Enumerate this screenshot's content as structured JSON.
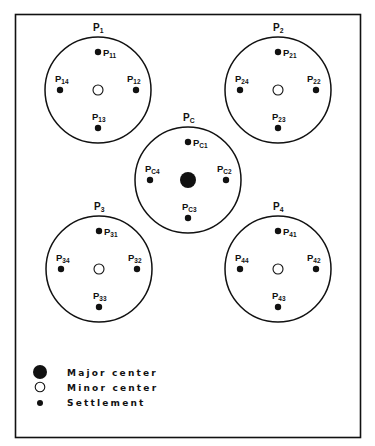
{
  "diagram": {
    "type": "central-place-hierarchy",
    "colors": {
      "ink": "#111111",
      "background": "#ffffff"
    },
    "regions": [
      {
        "id": "P1",
        "label": "P",
        "sub": "1",
        "cx": 98,
        "cy": 90,
        "r": 53,
        "center": "minor",
        "settlements": [
          {
            "label": "P",
            "sub": "11",
            "pos": "top"
          },
          {
            "label": "P",
            "sub": "12",
            "pos": "right"
          },
          {
            "label": "P",
            "sub": "13",
            "pos": "bottom"
          },
          {
            "label": "P",
            "sub": "14",
            "pos": "left"
          }
        ]
      },
      {
        "id": "P2",
        "label": "P",
        "sub": "2",
        "cx": 278,
        "cy": 90,
        "r": 53,
        "center": "minor",
        "settlements": [
          {
            "label": "P",
            "sub": "21",
            "pos": "top"
          },
          {
            "label": "P",
            "sub": "22",
            "pos": "right"
          },
          {
            "label": "P",
            "sub": "23",
            "pos": "bottom"
          },
          {
            "label": "P",
            "sub": "24",
            "pos": "left"
          }
        ]
      },
      {
        "id": "PC",
        "label": "P",
        "sub": "C",
        "cx": 188,
        "cy": 180,
        "r": 53,
        "center": "major",
        "settlements": [
          {
            "label": "P",
            "sub": "C1",
            "pos": "top"
          },
          {
            "label": "P",
            "sub": "C2",
            "pos": "right"
          },
          {
            "label": "P",
            "sub": "C3",
            "pos": "bottom"
          },
          {
            "label": "P",
            "sub": "C4",
            "pos": "left"
          }
        ]
      },
      {
        "id": "P3",
        "label": "P",
        "sub": "3",
        "cx": 99,
        "cy": 269,
        "r": 53,
        "center": "minor",
        "settlements": [
          {
            "label": "P",
            "sub": "31",
            "pos": "top"
          },
          {
            "label": "P",
            "sub": "32",
            "pos": "right"
          },
          {
            "label": "P",
            "sub": "33",
            "pos": "bottom"
          },
          {
            "label": "P",
            "sub": "34",
            "pos": "left"
          }
        ]
      },
      {
        "id": "P4",
        "label": "P",
        "sub": "4",
        "cx": 278,
        "cy": 269,
        "r": 53,
        "center": "minor",
        "settlements": [
          {
            "label": "P",
            "sub": "41",
            "pos": "top"
          },
          {
            "label": "P",
            "sub": "42",
            "pos": "right"
          },
          {
            "label": "P",
            "sub": "43",
            "pos": "bottom"
          },
          {
            "label": "P",
            "sub": "44",
            "pos": "left"
          }
        ]
      }
    ]
  },
  "legend": {
    "items": [
      {
        "symbol": "major-center",
        "label": "Major center"
      },
      {
        "symbol": "minor-center",
        "label": "Minor center"
      },
      {
        "symbol": "settlement",
        "label": "Settlement"
      }
    ]
  }
}
